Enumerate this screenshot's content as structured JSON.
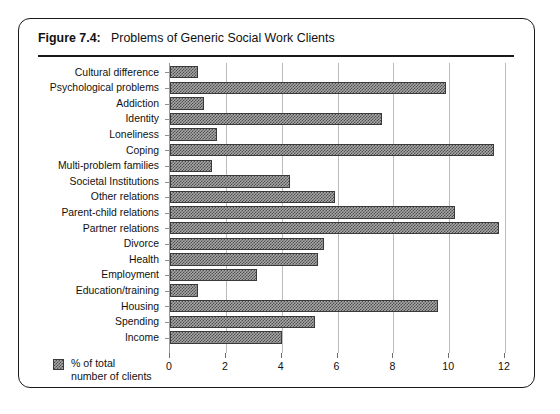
{
  "figure": {
    "label": "Figure 7.4:",
    "title": "Problems of Generic Social Work Clients"
  },
  "legend": {
    "swatch_name": "hatched-swatch",
    "line1": "% of total",
    "line2": "number of clients"
  },
  "colors": {
    "border": "#1a1a1a",
    "bar_fill": "#a8a8a8",
    "bar_hatch": "#4d4d4d",
    "bar_outline": "#3a3a3a",
    "gridline": "#bcbcbc",
    "text": "#111111",
    "background": "#ffffff"
  },
  "chart_data": {
    "type": "bar",
    "orientation": "horizontal",
    "title": "Problems of Generic Social Work Clients",
    "xlabel": "",
    "ylabel": "",
    "xlim": [
      0,
      12
    ],
    "grid": true,
    "legend_position": "bottom-left",
    "series_name": "% of total number of clients",
    "xticks": [
      0,
      2,
      4,
      6,
      8,
      10,
      12
    ],
    "xtick_labels": [
      "0",
      "2",
      "4",
      "6",
      "8",
      "10",
      "12"
    ],
    "categories": [
      "Cultural difference",
      "Psychological problems",
      "Addiction",
      "Identity",
      "Loneliness",
      "Coping",
      "Multi-problem families",
      "Societal Institutions",
      "Other relations",
      "Parent-child relations",
      "Partner relations",
      "Divorce",
      "Health",
      "Employment",
      "Education/training",
      "Housing",
      "Spending",
      "Income"
    ],
    "values": [
      1.0,
      9.9,
      1.2,
      7.6,
      1.7,
      11.6,
      1.5,
      4.3,
      5.9,
      10.2,
      11.8,
      5.5,
      5.3,
      3.1,
      1.0,
      9.6,
      5.2,
      4.0
    ]
  }
}
